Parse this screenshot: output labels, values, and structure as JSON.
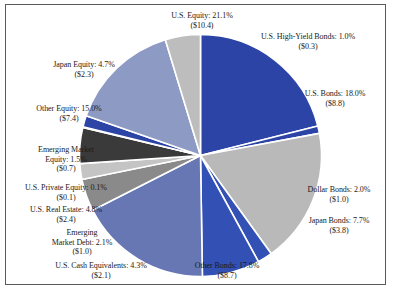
{
  "chart_data": {
    "type": "pie",
    "title": "",
    "subtitle": "",
    "xlabel": "",
    "ylabel": "",
    "legend_position": "none",
    "grid": false,
    "value_unit": "trillions of U.S. dollars",
    "categories": [
      "U.S. Equity",
      "U.S. High-Yield Bonds",
      "U.S. Bonds",
      "Dollar Bonds",
      "Japan Bonds",
      "Other Bonds",
      "U.S. Cash Equivalents",
      "Emerging Market Debt",
      "U.S. Real Estate",
      "U.S. Private Equity",
      "Emerging Market Equity",
      "Other Equity",
      "Japan Equity"
    ],
    "values": [
      21.1,
      1.0,
      18.0,
      2.0,
      7.7,
      17.8,
      4.3,
      2.1,
      4.8,
      0.1,
      1.5,
      15.0,
      4.7
    ],
    "amounts": [
      10.4,
      0.3,
      8.8,
      1.0,
      3.8,
      8.7,
      2.1,
      1.0,
      2.4,
      0.1,
      0.7,
      7.4,
      2.3
    ],
    "colors": [
      "#2b44a6",
      "#2b44a6",
      "#b9b9b9",
      "#3350b4",
      "#3350b4",
      "#6677b4",
      "#8a8a8a",
      "#c4c4c4",
      "#3a3a3a",
      "#101010",
      "#2b44a6",
      "#8d9ac4",
      "#bdbdbd"
    ]
  },
  "slices": [
    {
      "name": "us-equity",
      "line1": "U.S. Equity: 21.1%",
      "line2": "($10.4)",
      "percent": "21.1%",
      "amount": "$10.4",
      "color": "#2b44a6"
    },
    {
      "name": "us-high-yield-bonds",
      "line1": "U.S. High-Yield Bonds: 1.0%",
      "line2": "($0.3)",
      "percent": "1.0%",
      "amount": "$0.3",
      "color": "#2b44a6"
    },
    {
      "name": "us-bonds",
      "line1": "U.S. Bonds: 18.0%",
      "line2": "($8.8)",
      "percent": "18.0%",
      "amount": "$8.8",
      "color": "#b9b9b9"
    },
    {
      "name": "dollar-bonds",
      "line1": "Dollar Bonds: 2.0%",
      "line2": "($1.0)",
      "percent": "2.0%",
      "amount": "$1.0",
      "color": "#3350b4"
    },
    {
      "name": "japan-bonds",
      "line1": "Japan Bonds: 7.7%",
      "line2": "($3.8)",
      "percent": "7.7%",
      "amount": "$3.8",
      "color": "#3350b4"
    },
    {
      "name": "other-bonds",
      "line1": "Other Bonds: 17.8%",
      "line2": "($8.7)",
      "percent": "17.8%",
      "amount": "$8.7",
      "color": "#6677b4"
    },
    {
      "name": "us-cash-equivalents",
      "line1": "U.S. Cash Equivalents: 4.3%",
      "line2": "($2.1)",
      "percent": "4.3%",
      "amount": "$2.1",
      "color": "#8a8a8a"
    },
    {
      "name": "emerging-market-debt",
      "line1": "Emerging",
      "line2": "Market Debt: 2.1%",
      "line3": "($1.0)",
      "percent": "2.1%",
      "amount": "$1.0",
      "color": "#c4c4c4"
    },
    {
      "name": "us-real-estate",
      "line1": "U.S. Real Estate: 4.8%",
      "line2": "($2.4)",
      "percent": "4.8%",
      "amount": "$2.4",
      "color": "#3a3a3a"
    },
    {
      "name": "us-private-equity",
      "line1": "U.S. Private Equity: 0.1%",
      "line2": "($0.1)",
      "percent": "0.1%",
      "amount": "$0.1",
      "color": "#101010"
    },
    {
      "name": "emerging-market-equity",
      "line1": "Emerging Market",
      "line2": "Equity: 1.5%",
      "line3": "($0.7)",
      "percent": "1.5%",
      "amount": "$0.7",
      "color": "#2b44a6"
    },
    {
      "name": "other-equity",
      "line1": "Other Equity: 15.0%",
      "line2": "($7.4)",
      "percent": "15.0%",
      "amount": "$7.4",
      "color": "#8d9ac4"
    },
    {
      "name": "japan-equity",
      "line1": "Japan Equity: 4.7%",
      "line2": "($2.3)",
      "percent": "4.7%",
      "amount": "$2.3",
      "color": "#bdbdbd"
    }
  ]
}
